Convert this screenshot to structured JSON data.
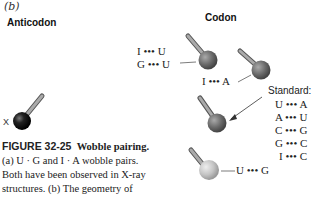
{
  "panel_label": "(b)",
  "anticodon_heading": "Anticodon",
  "codon_heading": "Codon",
  "anticodon_marker": "X",
  "pairs": {
    "group1": [
      "I ••• U",
      "G ••• U"
    ],
    "group2": "I ••• A",
    "group3": "U ••• G"
  },
  "standard": {
    "label": "Standard:",
    "pairs": [
      "U ••• A",
      "A ••• U",
      "C ••• G",
      "G ••• C",
      "I ••• C"
    ]
  },
  "caption": {
    "figure_number": "FIGURE 32-25",
    "title": "Wobble pairing.",
    "lines": [
      "(a) U · G and I · A wobble pairs.",
      "Both have been observed in X-ray",
      "structures. (b) The geometry of"
    ]
  },
  "colors": {
    "anticodon_ball": "#111111",
    "codon_ball_dark": "#6a6a6a",
    "codon_ball_mid": "#7a7a7a",
    "codon_ball_light": "#c0c0c0",
    "stick": "#8a8a8a"
  }
}
